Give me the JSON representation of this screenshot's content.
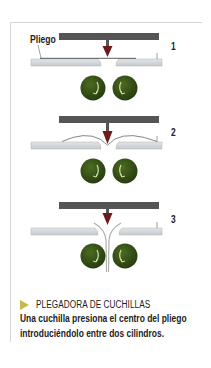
{
  "diagram": {
    "label_sheet": "Pliego",
    "steps": [
      {
        "number": "1",
        "state": "flat-sheet"
      },
      {
        "number": "2",
        "state": "knife-presses-center"
      },
      {
        "number": "3",
        "state": "sheet-between-rollers"
      }
    ],
    "colors": {
      "knife_bar": "#555555",
      "knife_tip": "#6e1a1a",
      "plate": "#cfd3d6",
      "roller": "#2f4a14",
      "roller_arrow": "#cfe0a8",
      "caption_marker": "#c8b84a",
      "frame": "#d6d6d6"
    }
  },
  "caption": {
    "title": "PLEGADORA DE CUCHILLAS",
    "body_line_1": "Una cuchilla presiona el centro del pliego",
    "body_line_2": "introduciéndolo entre dos cilindros."
  }
}
